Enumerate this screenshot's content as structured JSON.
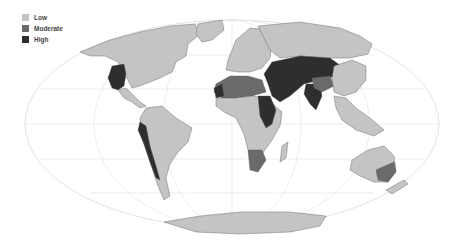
{
  "legend": {
    "items": [
      {
        "label": "Low",
        "color": "#c4c4c4"
      },
      {
        "label": "Moderate",
        "color": "#6a6a6a"
      },
      {
        "label": "High",
        "color": "#2e2e2e"
      }
    ]
  },
  "map": {
    "projection": "Mollweide",
    "ocean_color": "#ffffff",
    "graticule_color": "#dddddd",
    "border_color": "#555555",
    "regions": [
      {
        "name": "North America (Canada/USA)",
        "category": "Low"
      },
      {
        "name": "Western USA / Mexico",
        "category": "High"
      },
      {
        "name": "Greenland",
        "category": "Low"
      },
      {
        "name": "South America",
        "category": "Low"
      },
      {
        "name": "Western South America coast (Peru/Chile)",
        "category": "High"
      },
      {
        "name": "Europe",
        "category": "Low"
      },
      {
        "name": "North Africa (Sahara)",
        "category": "Moderate"
      },
      {
        "name": "Northwest Africa",
        "category": "High"
      },
      {
        "name": "Sudan / Nile basin",
        "category": "High"
      },
      {
        "name": "Sub-Saharan Africa",
        "category": "Low"
      },
      {
        "name": "Southern Africa",
        "category": "Moderate"
      },
      {
        "name": "Middle East / Central Asia",
        "category": "High"
      },
      {
        "name": "India",
        "category": "High"
      },
      {
        "name": "Russia",
        "category": "Low"
      },
      {
        "name": "China / East Asia",
        "category": "Low"
      },
      {
        "name": "Tibet",
        "category": "Moderate"
      },
      {
        "name": "Southeast Asia",
        "category": "Low"
      },
      {
        "name": "Australia",
        "category": "Low"
      },
      {
        "name": "Southeast Australia",
        "category": "Moderate"
      },
      {
        "name": "Antarctica",
        "category": "Low"
      }
    ]
  }
}
